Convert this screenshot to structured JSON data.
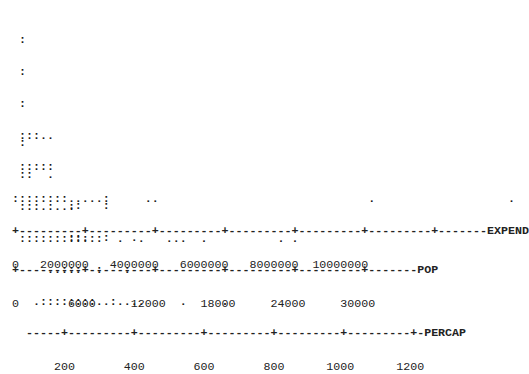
{
  "chart_data": [
    {
      "type": "scatter",
      "subtype": "dot-plot",
      "variable": "EXPEND",
      "title": "",
      "xlabel": "EXPEND",
      "tick_labels": [
        "0",
        "2000000",
        "4000000",
        "6000000",
        "8000000",
        "10000000"
      ],
      "xlim": [
        0,
        12000000
      ],
      "grid": false,
      "note": "Text-based dot plot; ':' represents 2 observations, '.' represents 1. Heavy right skew with most values below ~2,500,000 and outliers near 4.6M, 9.5M and 11.5M.",
      "rows": [
        " :",
        " :",
        " :",
        " :::..",
        " :::::",
        "::::::::.....:     ..                              .                   .",
        "+---------+---------+---------+---------+---------+---------+-------EXPEND",
        "0   2000000   4000000   6000000   8000000  10000000"
      ]
    },
    {
      "type": "scatter",
      "subtype": "dot-plot",
      "variable": "POP",
      "title": "",
      "xlabel": "POP",
      "tick_labels": [
        "0",
        "6000",
        "12000",
        "18000",
        "24000",
        "30000"
      ],
      "xlim": [
        0,
        36000
      ],
      "grid": false,
      "note": "Right-skewed; bulk below ~7,000 with scattered values up to ~30,000.",
      "rows": [
        " :",
        " ::  .",
        " :::.:..:",
        " ::::::::::::  .  .   ...  .          . .",
        "+---------+---------+---------+---------+---------+-------POP",
        "0       6000     12000     18000     24000     30000"
      ]
    },
    {
      "type": "scatter",
      "subtype": "dot-plot",
      "variable": "PERCAP",
      "title": "",
      "xlabel": "PERCAP",
      "tick_labels": [
        "200",
        "400",
        "600",
        "800",
        "1000",
        "1200"
      ],
      "xlim": [
        100,
        1250
      ],
      "grid": false,
      "note": "Mode around 200–300; outliers near 500, 620 and 1200.",
      "rows": [
        "        .:   :",
        "        ::.  :   .",
        "     ..:::  :   :",
        "   .::::::::..:....     .     .",
        "  -----+---------+---------+---------+---------+---------+-PERCAP",
        "      200       400       600       800      1000      1200"
      ]
    }
  ]
}
